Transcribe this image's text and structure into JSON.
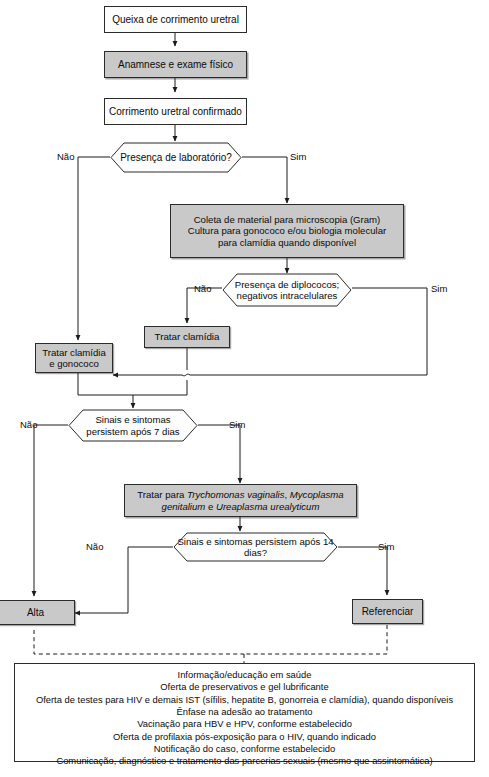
{
  "diagram": {
    "colors": {
      "shaded_fill": "#c9c9c9",
      "plain_fill": "#fdfdfd",
      "stroke": "#2b2b2b",
      "text": "#0b0b0b"
    }
  },
  "nodes": {
    "n1": {
      "label": "Queixa de corrimento uretral",
      "shape": "box",
      "style": "plain"
    },
    "n2": {
      "label": "Anamnese e exame físico",
      "shape": "box",
      "style": "shaded"
    },
    "n3": {
      "label": "Corrimento uretral confirmado",
      "shape": "box",
      "style": "plain"
    },
    "d1": {
      "label": "Presença de laboratório?",
      "shape": "hexagon",
      "style": "plain"
    },
    "n4": {
      "shape": "box",
      "style": "shaded",
      "line1": "Coleta de material para microscopia (Gram)",
      "line2": "Cultura para gonococo e/ou biologia molecular",
      "line3": "para clamídia quando disponível"
    },
    "d2": {
      "shape": "hexagon",
      "style": "plain",
      "line1": "Presença de diplococos;",
      "line2": "negativos intracelulares"
    },
    "n5": {
      "label": "Tratar clamídia",
      "shape": "box",
      "style": "shaded"
    },
    "n6": {
      "shape": "box",
      "style": "shaded",
      "line1": "Tratar clamídia",
      "line2": "e gonococo"
    },
    "d3": {
      "shape": "hexagon",
      "style": "plain",
      "line1": "Sinais e sintomas",
      "line2": "persistem após 7 dias"
    },
    "n7": {
      "shape": "box",
      "style": "shaded",
      "line1_pre": "Tratar para ",
      "line1_sp1": "Trychomonas vaginalis",
      "line1_mid": ", ",
      "line1_sp2": "Mycoplasma",
      "line2_sp1": "genitalium",
      "line2_mid": " e ",
      "line2_sp2": "Ureaplasma urealyticum"
    },
    "d4": {
      "label": "Sinais e sintomas persistem após 14 dias?",
      "shape": "hexagon",
      "style": "plain"
    },
    "n8": {
      "label": "Alta",
      "shape": "box",
      "style": "shaded"
    },
    "n9": {
      "label": "Referenciar",
      "shape": "box",
      "style": "shaded"
    }
  },
  "edge_labels": {
    "d1_nao": "Não",
    "d1_sim": "Sim",
    "d2_nao": "Não",
    "d2_sim": "Sim",
    "d3_nao": "Não",
    "d3_sim": "Sim",
    "d4_nao": "Não",
    "d4_sim": "Sim"
  },
  "info_box": {
    "lines": [
      "Informação/educação em saúde",
      "Oferta de preservativos e gel lubrificante",
      "Oferta de testes para HIV e demais IST (sífilis, hepatite B, gonorreia e clamídia), quando disponíveis",
      "Ênfase na adesão ao tratamento",
      "Vacinação para HBV e HPV, conforme estabelecido",
      "Oferta de profilaxia pós-exposição para o HIV, quando indicado",
      "Notificação do caso, conforme estabelecido",
      "Comunicação, diagnóstico e tratamento das parcerias sexuais (mesmo que assintomática)"
    ]
  }
}
